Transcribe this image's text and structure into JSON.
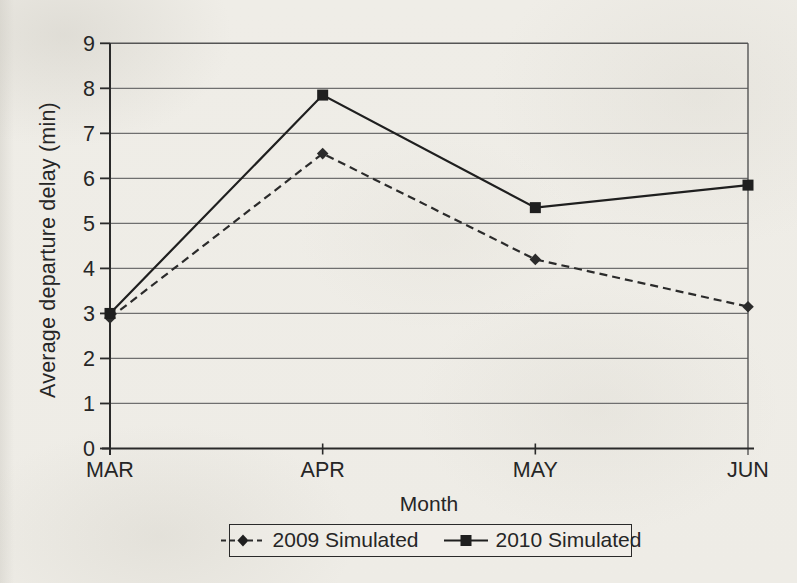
{
  "page": {
    "kind": "scanned printed figure",
    "paper_color": "#f0eee8",
    "ink_color": "#2a2a2a",
    "grid_color": "#6f6f6f"
  },
  "chart_data": {
    "type": "line",
    "xlabel": "Month",
    "ylabel": "Average departure delay (min)",
    "categories": [
      "MAR",
      "APR",
      "MAY",
      "JUN"
    ],
    "ylim": [
      0,
      9
    ],
    "yticks": [
      0,
      1,
      2,
      3,
      4,
      5,
      6,
      7,
      8,
      9
    ],
    "grid": "horizontal gridlines at every integer",
    "legend_position": "bottom-center boxed",
    "series": [
      {
        "name": "2009 Simulated",
        "values": [
          2.9,
          6.55,
          4.2,
          3.15
        ],
        "line_style": "dashed",
        "marker": "diamond",
        "color": "#2b2b2b"
      },
      {
        "name": "2010 Simulated",
        "values": [
          3.0,
          7.85,
          5.35,
          5.85
        ],
        "line_style": "solid",
        "marker": "square",
        "color": "#1f1f1f"
      }
    ]
  }
}
